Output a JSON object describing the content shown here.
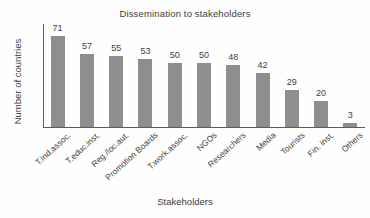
{
  "chart_data": {
    "type": "bar",
    "title": "Dissemination to stakeholders",
    "xlabel": "Stakeholders",
    "ylabel": "Number of countries",
    "categories": [
      "T.ind.assoc.",
      "T.educ.inst.",
      "Reg./loc.aut.",
      "Promotion Boards",
      "T.work.assoc.",
      "NGOs",
      "Researchers",
      "Media",
      "Tourists",
      "Fin. inst.",
      "Others"
    ],
    "values": [
      71,
      57,
      55,
      53,
      50,
      50,
      48,
      42,
      29,
      20,
      3
    ],
    "value_labels": [
      "71",
      "57",
      "55",
      "53",
      "50",
      "50",
      "48",
      "42",
      "29",
      "20",
      "3"
    ],
    "ylim": [
      0,
      80
    ],
    "grid": false,
    "legend": "none",
    "bar_color": "#8e8e8e",
    "axis_color": "#5c5c5c",
    "text_color": "#3d3d3d",
    "background": "#fefefe",
    "y_tick_labels": []
  }
}
